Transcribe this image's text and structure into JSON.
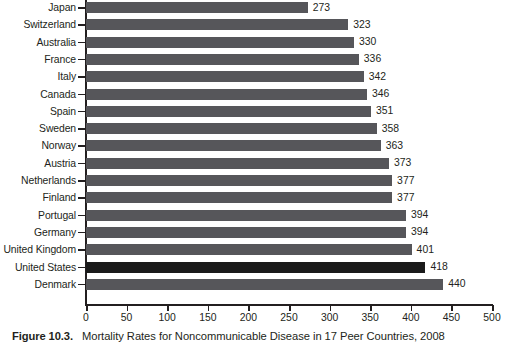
{
  "caption": {
    "label": "Figure 10.3.",
    "text": "Mortality Rates for Noncommunicable Disease in 17 Peer Countries, 2008"
  },
  "colors": {
    "bar": "#56565a",
    "bar_highlight": "#1a1a1a",
    "axis": "#231f20",
    "text": "#231f20"
  },
  "chart_data": {
    "type": "bar",
    "orientation": "horizontal",
    "title": "Mortality Rates for Noncommunicable Disease in 17 Peer Countries, 2008",
    "xlabel": "",
    "ylabel": "",
    "xlim": [
      0,
      500
    ],
    "grid": false,
    "legend": false,
    "highlight_category": "United States",
    "xticks": [
      "0",
      "50",
      "100",
      "150",
      "200",
      "250",
      "300",
      "350",
      "400",
      "450",
      "500"
    ],
    "xtick_values": [
      0,
      50,
      100,
      150,
      200,
      250,
      300,
      350,
      400,
      450,
      500
    ],
    "categories": [
      "Japan",
      "Switzerland",
      "Australia",
      "France",
      "Italy",
      "Canada",
      "Spain",
      "Sweden",
      "Norway",
      "Austria",
      "Netherlands",
      "Finland",
      "Portugal",
      "Germany",
      "United Kingdom",
      "United States",
      "Denmark"
    ],
    "values": [
      273,
      323,
      330,
      336,
      342,
      346,
      351,
      358,
      363,
      373,
      377,
      377,
      394,
      394,
      401,
      418,
      440
    ],
    "labels": [
      "273",
      "323",
      "330",
      "336",
      "342",
      "346",
      "351",
      "358",
      "363",
      "373",
      "377",
      "377",
      "394",
      "394",
      "401",
      "418",
      "440"
    ]
  }
}
